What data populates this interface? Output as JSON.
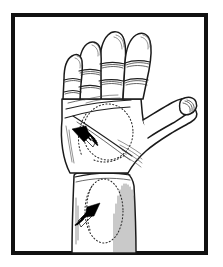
{
  "figure": {
    "caption": "",
    "style": "pen-and-ink line art",
    "background_color": "#ffffff",
    "ink_color": "#000000",
    "frame": {
      "label": "illustration-border",
      "color": "#111111",
      "thickness_px": 4,
      "x": 11,
      "y": 13,
      "width": 197,
      "height": 242
    },
    "subject": {
      "name": "left hand, palmar aspect with forearm",
      "orientation": "palm facing viewer, fingers pointing up, thumb abducted to the right",
      "parts": [
        "index finger",
        "middle finger",
        "ring finger",
        "little finger",
        "thumb",
        "palm",
        "thenar eminence",
        "hypothenar eminence",
        "wrist",
        "forearm"
      ]
    },
    "annotations": [
      {
        "id": "palm-marker",
        "label": "palm dotted oval region",
        "shape": "dotted oval",
        "center_x": 108,
        "center_y": 132,
        "radius_x": 25,
        "radius_y": 28,
        "arrow": {
          "label": "palm arrow",
          "direction": "up-left",
          "bearing_degrees": 305,
          "tip_x": 72,
          "tip_y": 129,
          "tail_x": 96,
          "tail_y": 149,
          "tail_style": "striped"
        }
      },
      {
        "id": "forearm-marker",
        "label": "forearm dotted oval region",
        "shape": "dotted oval",
        "center_x": 104,
        "center_y": 211,
        "radius_x": 19,
        "radius_y": 32,
        "arrow": {
          "label": "forearm arrow",
          "direction": "up-right",
          "bearing_degrees": 55,
          "tip_x": 100,
          "tip_y": 203,
          "tail_x": 76,
          "tail_y": 222,
          "tail_style": "striped"
        }
      }
    ],
    "legend": [],
    "text_labels": []
  }
}
